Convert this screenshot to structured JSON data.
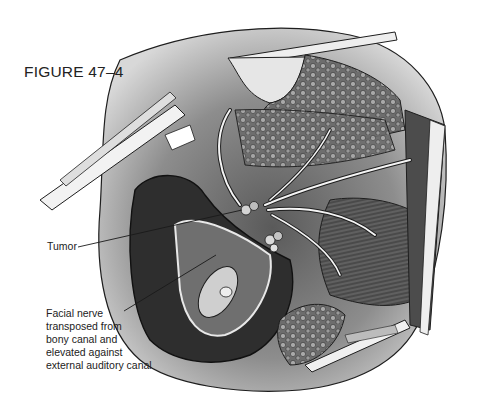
{
  "figure": {
    "label": "FIGURE 47–4"
  },
  "callouts": {
    "tumor": {
      "text": "Tumor"
    },
    "facial_nerve": {
      "lines": [
        "Facial nerve",
        "transposed from",
        "bony canal and",
        "elevated against",
        "external auditory canal"
      ]
    }
  },
  "illustration": {
    "subject": "surgical-field-drawing",
    "palette": {
      "ink": "#1e1e1e",
      "dark_tissue": "#3c3c3c",
      "mid_tissue": "#7a7a7a",
      "light_tissue": "#c9c9c9",
      "background": "#ffffff"
    }
  }
}
